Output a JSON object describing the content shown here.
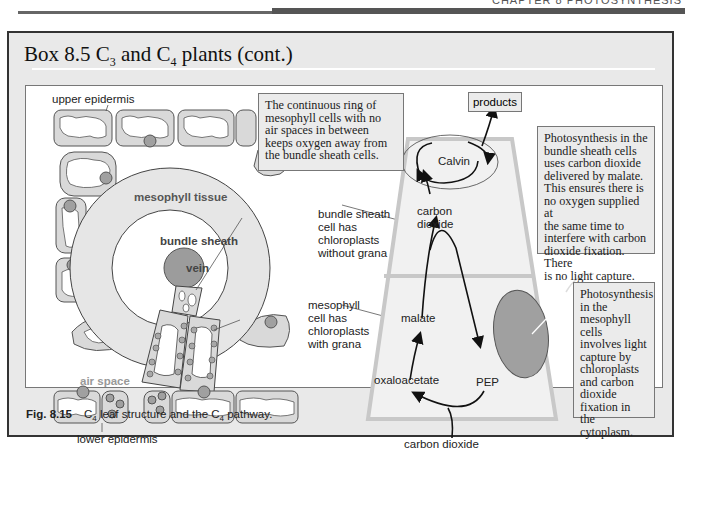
{
  "running_head": "CHAPTER 8 PHOTOSYNTHESIS",
  "box": {
    "title_prefix": "Box 8.5 C",
    "title_sub1": "3",
    "title_mid": " and C",
    "title_sub2": "4",
    "title_suffix": " plants (cont.)"
  },
  "diagram": {
    "labels": {
      "upper_epidermis": "upper epidermis",
      "lower_epidermis": "lower epidermis",
      "mesophyll_tissue": "mesophyll tissue",
      "bundle_sheath": "bundle sheath",
      "vein": "vein",
      "air_space": "air space",
      "bundle_sheath_cell": [
        "bundle sheath",
        "cell has",
        "chloroplasts",
        "without grana"
      ],
      "mesophyll_cell": [
        "mesophyll",
        "cell has",
        "chloroplasts",
        "with grana"
      ]
    },
    "notes": {
      "ring": [
        "The continuous ring of",
        "mesophyll cells with no",
        "air spaces in between",
        "keeps oxygen away from",
        "the bundle sheath cells."
      ],
      "bundle_sheath": [
        "Photosynthesis in the",
        "bundle sheath cells",
        "uses carbon dioxide",
        "delivered by malate.",
        "This ensures there is",
        "no oxygen supplied at",
        "the same time to",
        "interfere with carbon",
        "dioxide fixation. There",
        "is no light capture."
      ],
      "mesophyll": [
        "Photosynthesis",
        "in the",
        "mesophyll cells",
        "involves light",
        "capture by",
        "chloroplasts",
        "and carbon",
        "dioxide",
        "fixation in the",
        "cytoplasm."
      ]
    },
    "pathway": {
      "products": "products",
      "calvin": "Calvin",
      "carbon_dioxide_upper": [
        "carbon",
        "dioxide"
      ],
      "malate": "malate",
      "oxaloacetate": "oxaloacetate",
      "pep": "PEP",
      "carbon_dioxide_lower": "carbon dioxide"
    },
    "colors": {
      "box_bg": "#e9e9e9",
      "cell_fill": "#d9d9d9",
      "chloroplast": "#a0a0a0",
      "vein": "#9c9c9c",
      "mesophyll_disc": "#e6e6e6"
    }
  },
  "caption": {
    "fig": "Fig. 8.15",
    "text_prefix": "C",
    "sub1": "4",
    "text_mid": " leaf structure and the C",
    "sub2": "4",
    "text_suffix": " pathway."
  }
}
